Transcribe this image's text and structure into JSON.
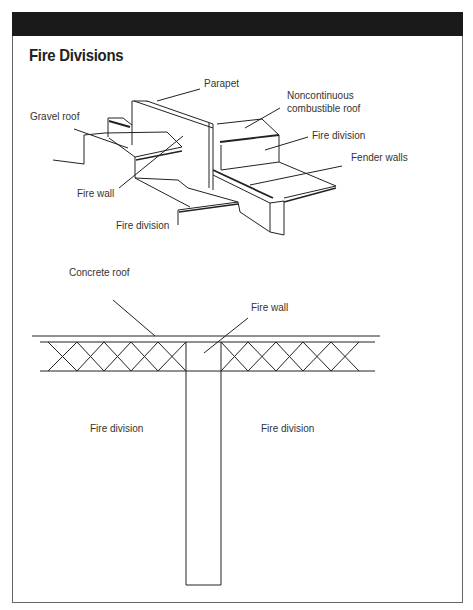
{
  "header": {
    "title": "Fire Divisions"
  },
  "top_diagram": {
    "labels": {
      "parapet": "Parapet",
      "noncontinuous_1": "Noncontinuous",
      "noncontinuous_2": "combustible roof",
      "gravel_roof": "Gravel roof",
      "fire_division_right": "Fire division",
      "fender_walls": "Fender walls",
      "fire_wall": "Fire wall",
      "fire_division_bottom": "Fire division"
    }
  },
  "bottom_diagram": {
    "labels": {
      "concrete_roof": "Concrete roof",
      "fire_wall": "Fire wall",
      "fire_division_left": "Fire division",
      "fire_division_right": "Fire division"
    }
  },
  "colors": {
    "header_bar": "#1a1a1a",
    "line": "#222222",
    "text": "#333333",
    "frame": "#666666"
  }
}
